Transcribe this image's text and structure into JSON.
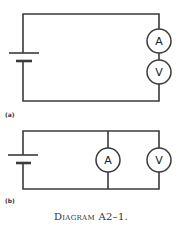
{
  "diagram_a": {
    "label": "(a)",
    "meters": [
      {
        "symbol": "A",
        "name": "ammeter"
      },
      {
        "symbol": "V",
        "name": "voltmeter"
      }
    ],
    "configuration": "series"
  },
  "diagram_b": {
    "label": "(b)",
    "meters": [
      {
        "symbol": "A",
        "name": "ammeter"
      },
      {
        "symbol": "V",
        "name": "voltmeter"
      }
    ],
    "configuration": "parallel"
  },
  "caption": "Diagram A2–1.",
  "colors": {
    "line": "#3a3a3a",
    "background": "#ffffff"
  }
}
